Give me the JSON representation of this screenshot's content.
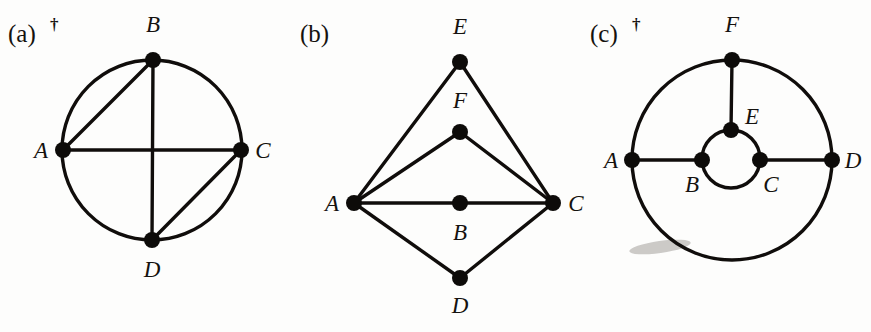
{
  "figure": {
    "background_color": "#fdfdfc",
    "ink_color": "#100d0b",
    "panels": [
      {
        "id": "a",
        "tag": "(a)",
        "dagger": "†",
        "has_dagger": true,
        "shape": "circle-with-two-diameters-and-two-chords",
        "circle": {
          "cx": 152,
          "cy": 150,
          "r": 90
        },
        "vertices": [
          {
            "name": "A",
            "label": "A",
            "x": 63,
            "y": 150,
            "label_x": 41,
            "label_y": 158
          },
          {
            "name": "B",
            "label": "B",
            "x": 153,
            "y": 60,
            "label_x": 153,
            "label_y": 32
          },
          {
            "name": "C",
            "label": "C",
            "x": 241,
            "y": 150,
            "label_x": 263,
            "label_y": 158
          },
          {
            "name": "D",
            "label": "D",
            "x": 152,
            "y": 240,
            "label_x": 152,
            "label_y": 277
          }
        ],
        "edges": [
          {
            "from": "A",
            "to": "C"
          },
          {
            "from": "B",
            "to": "D"
          },
          {
            "from": "A",
            "to": "B"
          },
          {
            "from": "C",
            "to": "D"
          }
        ]
      },
      {
        "id": "b",
        "tag": "(b)",
        "dagger": "",
        "has_dagger": false,
        "shape": "diamond-with-interior-spokes",
        "vertices": [
          {
            "name": "A",
            "label": "A",
            "x": 354,
            "y": 203,
            "label_x": 332,
            "label_y": 211
          },
          {
            "name": "B",
            "label": "B",
            "x": 460,
            "y": 203,
            "label_x": 460,
            "label_y": 240
          },
          {
            "name": "C",
            "label": "C",
            "x": 553,
            "y": 203,
            "label_x": 576,
            "label_y": 211
          },
          {
            "name": "D",
            "label": "D",
            "x": 460,
            "y": 278,
            "label_x": 460,
            "label_y": 313
          },
          {
            "name": "E",
            "label": "E",
            "x": 460,
            "y": 62,
            "label_x": 460,
            "label_y": 34
          },
          {
            "name": "F",
            "label": "F",
            "x": 460,
            "y": 132,
            "label_x": 460,
            "label_y": 108
          }
        ],
        "edges": [
          {
            "from": "A",
            "to": "E"
          },
          {
            "from": "E",
            "to": "C"
          },
          {
            "from": "A",
            "to": "F"
          },
          {
            "from": "F",
            "to": "C"
          },
          {
            "from": "A",
            "to": "B"
          },
          {
            "from": "B",
            "to": "C"
          },
          {
            "from": "A",
            "to": "D"
          },
          {
            "from": "D",
            "to": "C"
          }
        ]
      },
      {
        "id": "c",
        "tag": "(c)",
        "dagger": "†",
        "has_dagger": true,
        "shape": "outer-circle-with-concentric-inner-circle-and-three-spokes",
        "outer_circle": {
          "cx": 732,
          "cy": 160,
          "r": 100
        },
        "inner_circle": {
          "cx": 731,
          "cy": 159,
          "r": 29
        },
        "vertices": [
          {
            "name": "A",
            "label": "A",
            "x": 632,
            "y": 160,
            "label_x": 611,
            "label_y": 168
          },
          {
            "name": "B",
            "label": "B",
            "x": 702,
            "y": 160,
            "label_x": 692,
            "label_y": 192
          },
          {
            "name": "C",
            "label": "C",
            "x": 760,
            "y": 160,
            "label_x": 771,
            "label_y": 192
          },
          {
            "name": "D",
            "label": "D",
            "x": 832,
            "y": 160,
            "label_x": 853,
            "label_y": 168
          },
          {
            "name": "E",
            "label": "E",
            "x": 731,
            "y": 130,
            "label_x": 752,
            "label_y": 124
          },
          {
            "name": "F",
            "label": "F",
            "x": 732,
            "y": 60,
            "label_x": 732,
            "label_y": 32
          }
        ],
        "edges": [
          {
            "from": "A",
            "to": "B"
          },
          {
            "from": "C",
            "to": "D"
          },
          {
            "from": "F",
            "to": "E"
          }
        ]
      }
    ],
    "artifacts": [
      {
        "name": "scan-smudge",
        "cx": 660,
        "cy": 247,
        "rx": 31,
        "ry": 6,
        "rotate": -8
      }
    ],
    "vertex_radius": 8
  }
}
